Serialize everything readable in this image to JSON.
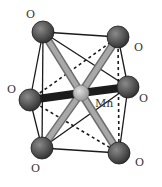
{
  "diagram": {
    "center_atom": {
      "id": "Mn",
      "label": "Mn",
      "x": 81,
      "y": 93,
      "r": 8,
      "label_x": 95,
      "label_y": 107
    },
    "atoms": [
      {
        "id": "O_tl",
        "label": "O",
        "x": 43,
        "y": 32,
        "r": 11,
        "label_x": 26,
        "label_y": 18
      },
      {
        "id": "O_tr",
        "label": "O",
        "x": 118,
        "y": 37,
        "r": 11,
        "label_x": 134,
        "label_y": 51
      },
      {
        "id": "O_l",
        "label": "O",
        "x": 30,
        "y": 100,
        "r": 11,
        "label_x": 7,
        "label_y": 93
      },
      {
        "id": "O_r",
        "label": "O",
        "x": 128,
        "y": 87,
        "r": 11,
        "label_x": 139,
        "label_y": 102
      },
      {
        "id": "O_bl",
        "label": "O",
        "x": 42,
        "y": 148,
        "r": 11,
        "label_x": 31,
        "label_y": 172
      },
      {
        "id": "O_br",
        "label": "O",
        "x": 119,
        "y": 153,
        "r": 11,
        "label_x": 135,
        "label_y": 166
      }
    ],
    "bonds": [
      {
        "to": "O_tl",
        "style": "light"
      },
      {
        "to": "O_br",
        "style": "light"
      },
      {
        "to": "O_tr",
        "style": "light"
      },
      {
        "to": "O_bl",
        "style": "light"
      },
      {
        "to": "O_l",
        "style": "dark"
      },
      {
        "to": "O_r",
        "style": "dark"
      }
    ],
    "edges_solid": [
      [
        "O_tl",
        "O_tr"
      ],
      [
        "O_tl",
        "O_r"
      ],
      [
        "O_tl",
        "O_l"
      ],
      [
        "O_tl",
        "O_bl"
      ],
      [
        "O_l",
        "O_bl"
      ],
      [
        "O_tr",
        "O_r"
      ],
      [
        "O_r",
        "O_br"
      ],
      [
        "O_bl",
        "O_r"
      ],
      [
        "O_bl",
        "O_br"
      ]
    ],
    "edges_dashed": [
      [
        "O_l",
        "O_tr"
      ],
      [
        "O_l",
        "O_br"
      ],
      [
        "O_tr",
        "O_br"
      ]
    ],
    "colors": {
      "background": "#ffffff",
      "edge": "#1a1a1a",
      "o_atom_light": "#8a8a8a",
      "o_atom_dark": "#2e2e2e",
      "mn_atom_light": "#e0e0e0",
      "mn_atom_dark": "#8c8c8c",
      "bond_light": "#a8a8a8",
      "bond_light_edge": "#6e6e6e",
      "bond_dark": "#1c1c1c",
      "label": "#333333"
    }
  }
}
